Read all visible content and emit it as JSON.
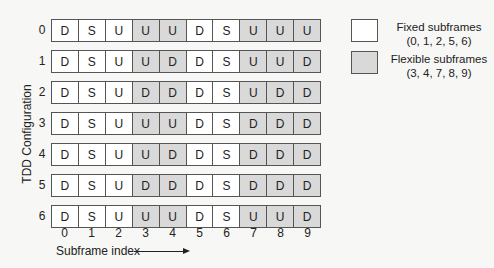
{
  "chart_data": {
    "type": "table",
    "title": "",
    "ylabel": "TDD Configuration",
    "xlabel": "Subframe index",
    "columns": [
      "0",
      "1",
      "2",
      "3",
      "4",
      "5",
      "6",
      "7",
      "8",
      "9"
    ],
    "rows": [
      {
        "config": "0",
        "subframes": [
          "D",
          "S",
          "U",
          "U",
          "U",
          "D",
          "S",
          "U",
          "U",
          "U"
        ]
      },
      {
        "config": "1",
        "subframes": [
          "D",
          "S",
          "U",
          "U",
          "D",
          "D",
          "S",
          "U",
          "U",
          "D"
        ]
      },
      {
        "config": "2",
        "subframes": [
          "D",
          "S",
          "U",
          "D",
          "D",
          "D",
          "S",
          "U",
          "D",
          "D"
        ]
      },
      {
        "config": "3",
        "subframes": [
          "D",
          "S",
          "U",
          "U",
          "U",
          "D",
          "S",
          "D",
          "D",
          "D"
        ]
      },
      {
        "config": "4",
        "subframes": [
          "D",
          "S",
          "U",
          "U",
          "D",
          "D",
          "S",
          "D",
          "D",
          "D"
        ]
      },
      {
        "config": "5",
        "subframes": [
          "D",
          "S",
          "U",
          "D",
          "D",
          "D",
          "S",
          "D",
          "D",
          "D"
        ]
      },
      {
        "config": "6",
        "subframes": [
          "D",
          "S",
          "U",
          "U",
          "U",
          "D",
          "S",
          "U",
          "U",
          "D"
        ]
      }
    ],
    "flexible_columns": [
      3,
      4,
      7,
      8,
      9
    ],
    "fixed_columns": [
      0,
      1,
      2,
      5,
      6
    ]
  },
  "legend": {
    "fixed": {
      "line1": "Fixed subframes",
      "line2": "(0, 1, 2, 5, 6)",
      "color": "#ffffff"
    },
    "flexible": {
      "line1": "Flexible subframes",
      "line2": "(3, 4, 7, 8, 9)",
      "color": "#d9d9d9"
    }
  },
  "axis": {
    "ylabel": "TDD Configuration",
    "xlabel": "Subframe index"
  }
}
